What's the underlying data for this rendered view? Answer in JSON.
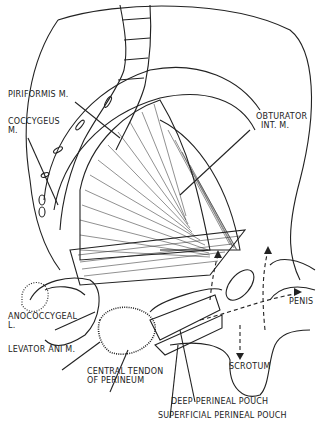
{
  "diagram": {
    "type": "anatomical illustration",
    "labels": {
      "piriformis": "PIRIFORMIS M.",
      "coccygeus_1": "COCCYGEUS",
      "coccygeus_2": "M.",
      "obturator_1": "OBTURATOR",
      "obturator_2": "INT. M.",
      "anococcygeal_1": "ANOCOCCYGEAL",
      "anococcygeal_2": "L.",
      "levator": "LEVATOR ANI M.",
      "central_1": "CENTRAL TENDON",
      "central_2": "OF PERINEUM",
      "penis": "PENIS",
      "scrotum": "SCROTUM",
      "deep": "DEEP PERINEAL POUCH",
      "superficial": "SUPERFICIAL PERINEAL POUCH"
    },
    "colors": {
      "line": "#222222",
      "background": "#ffffff"
    }
  }
}
